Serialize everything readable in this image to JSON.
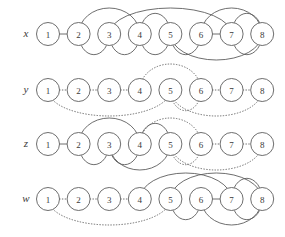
{
  "figure": {
    "type": "arc-diagram-set",
    "node_labels": [
      "1",
      "2",
      "3",
      "4",
      "5",
      "6",
      "7",
      "8"
    ],
    "node_count": 8,
    "line_styles": [
      "solid",
      "dotted"
    ],
    "colors": {
      "stroke": "#5d5d5d",
      "text": "#3a3a3a",
      "background": "#ffffff"
    }
  },
  "geometry": {
    "first_node_cx": 48,
    "node_spacing": 30.6,
    "node_radius": 11.5,
    "row_baselines": [
      34,
      90,
      144,
      199
    ]
  },
  "rows": [
    {
      "label": "x",
      "baseline": 34,
      "edges": [
        {
          "from": 1,
          "to": 2,
          "side": "straight",
          "style": "solid"
        },
        {
          "from": 2,
          "to": 3,
          "side": "below",
          "style": "solid"
        },
        {
          "from": 2,
          "to": 4,
          "side": "above",
          "style": "solid"
        },
        {
          "from": 3,
          "to": 4,
          "side": "below",
          "style": "solid"
        },
        {
          "from": 4,
          "to": 5,
          "side": "above",
          "style": "solid"
        },
        {
          "from": 4,
          "to": 5,
          "side": "below",
          "style": "solid"
        },
        {
          "from": 5,
          "to": 6,
          "side": "below",
          "style": "solid"
        },
        {
          "from": 3,
          "to": 7,
          "side": "above",
          "style": "solid"
        },
        {
          "from": 6,
          "to": 7,
          "side": "straight",
          "style": "solid"
        },
        {
          "from": 6,
          "to": 8,
          "side": "above",
          "style": "solid"
        },
        {
          "from": 5,
          "to": 8,
          "side": "below",
          "style": "solid"
        },
        {
          "from": 7,
          "to": 8,
          "side": "above",
          "style": "solid"
        },
        {
          "from": 7,
          "to": 8,
          "side": "below",
          "style": "solid"
        }
      ]
    },
    {
      "label": "y",
      "baseline": 90,
      "edges": [
        {
          "from": 1,
          "to": 2,
          "side": "straight",
          "style": "dotted"
        },
        {
          "from": 2,
          "to": 3,
          "side": "straight",
          "style": "dotted"
        },
        {
          "from": 3,
          "to": 4,
          "side": "straight",
          "style": "dotted"
        },
        {
          "from": 4,
          "to": 6,
          "side": "above",
          "style": "dotted"
        },
        {
          "from": 5,
          "to": 6,
          "side": "below",
          "style": "dotted"
        },
        {
          "from": 6,
          "to": 7,
          "side": "straight",
          "style": "dotted"
        },
        {
          "from": 7,
          "to": 8,
          "side": "straight",
          "style": "dotted"
        },
        {
          "from": 1,
          "to": 5,
          "side": "below",
          "style": "dotted"
        },
        {
          "from": 5,
          "to": 8,
          "side": "below",
          "style": "dotted"
        }
      ]
    },
    {
      "label": "z",
      "baseline": 144,
      "edges": [
        {
          "from": 1,
          "to": 2,
          "side": "straight",
          "style": "solid"
        },
        {
          "from": 2,
          "to": 3,
          "side": "below",
          "style": "solid"
        },
        {
          "from": 2,
          "to": 4,
          "side": "above",
          "style": "solid"
        },
        {
          "from": 3,
          "to": 4,
          "side": "below",
          "style": "solid"
        },
        {
          "from": 4,
          "to": 5,
          "side": "above",
          "style": "solid"
        },
        {
          "from": 3,
          "to": 5,
          "side": "below",
          "style": "solid"
        },
        {
          "from": 4,
          "to": 6,
          "side": "above",
          "style": "dotted"
        },
        {
          "from": 5,
          "to": 6,
          "side": "below",
          "style": "dotted"
        },
        {
          "from": 6,
          "to": 7,
          "side": "straight",
          "style": "dotted"
        },
        {
          "from": 7,
          "to": 8,
          "side": "straight",
          "style": "dotted"
        },
        {
          "from": 5,
          "to": 8,
          "side": "below",
          "style": "dotted"
        }
      ]
    },
    {
      "label": "w",
      "baseline": 199,
      "edges": [
        {
          "from": 1,
          "to": 2,
          "side": "straight",
          "style": "dotted"
        },
        {
          "from": 2,
          "to": 3,
          "side": "straight",
          "style": "dotted"
        },
        {
          "from": 3,
          "to": 4,
          "side": "straight",
          "style": "dotted"
        },
        {
          "from": 1,
          "to": 5,
          "side": "below",
          "style": "dotted"
        },
        {
          "from": 4,
          "to": 7,
          "side": "above",
          "style": "solid"
        },
        {
          "from": 5,
          "to": 6,
          "side": "below",
          "style": "solid"
        },
        {
          "from": 5,
          "to": 8,
          "side": "above",
          "style": "solid"
        },
        {
          "from": 6,
          "to": 7,
          "side": "straight",
          "style": "solid"
        },
        {
          "from": 6,
          "to": 8,
          "side": "below",
          "style": "solid"
        },
        {
          "from": 7,
          "to": 8,
          "side": "above",
          "style": "solid"
        },
        {
          "from": 7,
          "to": 8,
          "side": "below",
          "style": "solid"
        }
      ]
    }
  ]
}
